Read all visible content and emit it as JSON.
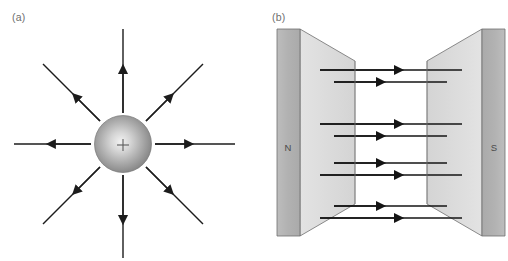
{
  "figure": {
    "width": 508,
    "height": 261,
    "background": "#ffffff",
    "panels": [
      {
        "id": "a",
        "label": "(a)",
        "caption_color": "#6e6e6e",
        "subject": "electric-field-lines-point-charge",
        "charge": {
          "sign": "+",
          "symbol": "+",
          "center_x": 123,
          "center_y": 144,
          "radius": 28,
          "fill_light": "#efefef",
          "fill_mid": "#a8a8a8",
          "fill_dark": "#6f6f6f",
          "edge": "#5a5a5a"
        },
        "field_lines": {
          "count": 8,
          "direction": "outward",
          "stroke": "#1c1c1c",
          "stroke_width": 1.4,
          "inner_radius": 32,
          "outer_radius": 112,
          "arrow_fraction": 0.42,
          "angles_deg": [
            0,
            45,
            90,
            135,
            180,
            225,
            270,
            315
          ]
        }
      },
      {
        "id": "b",
        "label": "(b)",
        "caption_color": "#6e6e6e",
        "subject": "magnetic-field-lines-between-poles",
        "poles": [
          {
            "name": "N",
            "side": "left",
            "letter_x": 292,
            "letter_y": 148,
            "face_fill": "#b4b4b4",
            "side_fill": "#dcdcdc",
            "edge": "#6a6a6a"
          },
          {
            "name": "S",
            "side": "right",
            "letter_x": 470,
            "letter_y": 148,
            "face_fill": "#b4b4b4",
            "side_fill": "#dcdcdc",
            "edge": "#6a6a6a"
          }
        ],
        "field_lines": {
          "direction": "left-to-right",
          "stroke": "#1c1c1c",
          "pair_count": 4,
          "lines_per_pair": 2,
          "pairs_y": [
            70,
            86,
            129,
            145,
            168,
            184,
            210,
            226
          ],
          "x_start_long": 320,
          "x_end_long": 462,
          "x_start_short": 334,
          "x_end_short": 447
        }
      }
    ]
  }
}
